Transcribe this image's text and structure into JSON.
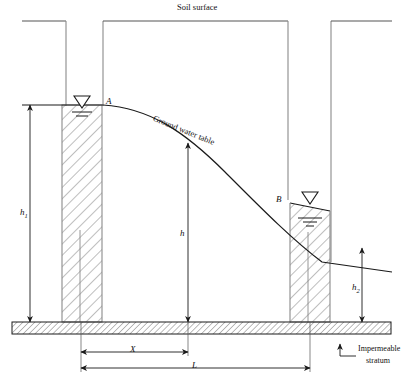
{
  "figure": {
    "width": 403,
    "height": 383
  },
  "labels": {
    "soil_surface": "Soil surface",
    "ground_water_table": "Ground water table",
    "point_a": "A",
    "point_b": "B",
    "h1": "h",
    "h1_sub": "1",
    "h": "h",
    "h2": "h",
    "h2_sub": "2",
    "dim_x": "X",
    "dim_l": "L",
    "impermeable_line1": "Impermeable",
    "impermeable_line2": "stratum"
  },
  "colors": {
    "line": "#1a1a1a",
    "hatch": "#6e6e6e",
    "wall": "#8a8a8a",
    "background": "#ffffff",
    "text": "#111111"
  },
  "geometry": {
    "soil_surface_y": 21,
    "stratum_top_y": 322,
    "stratum_bottom_y": 334,
    "left_well_x1": 62,
    "left_well_x2": 102,
    "right_well_x1": 290,
    "right_well_x2": 330,
    "water_table_left_y": 105,
    "water_table_right_y": 270,
    "point_a_x": 103,
    "point_a_y": 105,
    "point_b_x": 289,
    "point_b_y": 202,
    "dim_x_start": 81,
    "dim_x_end": 188,
    "dim_l_start": 81,
    "dim_l_end": 310,
    "h1_top_y": 105,
    "h_top_y": 143,
    "h_x": 188,
    "h2_top_y": 248,
    "h2_x": 362
  }
}
